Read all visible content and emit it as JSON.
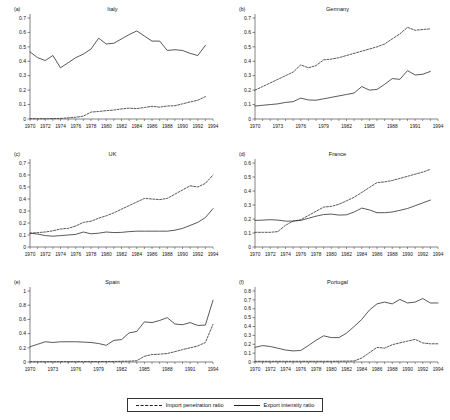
{
  "figure": {
    "legend": {
      "position": "bottom-center",
      "entries": [
        {
          "label": "Import penetration ratio",
          "style": "dashed"
        },
        {
          "label": "Export intensity ratio",
          "style": "solid"
        }
      ]
    },
    "series_names": {
      "import": "Import penetration ratio",
      "export": "Export intensity ratio"
    },
    "colors": {
      "line": "#222222",
      "axis": "#333333",
      "background": "#ffffff"
    }
  },
  "chart_data": [
    {
      "type": "line",
      "panel": "(a)",
      "title": "Italy",
      "xlabel": "",
      "ylabel": "",
      "xlim": [
        1970,
        1994
      ],
      "ylim": [
        0,
        0.7
      ],
      "yticks": [
        0,
        0.1,
        0.2,
        0.3,
        0.4,
        0.5,
        0.6,
        0.7
      ],
      "yticklabels": [
        "0",
        "0.1",
        "0.2",
        "0.3",
        "0.4",
        "0.5",
        "0.6",
        "0.7"
      ],
      "xticks": [
        1970,
        1972,
        1974,
        1976,
        1978,
        1980,
        1982,
        1984,
        1986,
        1988,
        1990,
        1992,
        1994
      ],
      "xticklabels": [
        "1970",
        "1972",
        "1974",
        "1976",
        "1978",
        "1980",
        "1982",
        "1984",
        "1986",
        "1988",
        "1990",
        "1992",
        "1994"
      ],
      "grid": false,
      "x": [
        1970,
        1971,
        1972,
        1973,
        1974,
        1975,
        1976,
        1977,
        1978,
        1979,
        1980,
        1981,
        1982,
        1983,
        1984,
        1985,
        1986,
        1987,
        1988,
        1989,
        1990,
        1991,
        1992,
        1993
      ],
      "series": [
        {
          "name": "Export intensity ratio",
          "style": "solid",
          "values": [
            0.465,
            0.425,
            0.405,
            0.44,
            0.355,
            0.39,
            0.425,
            0.45,
            0.485,
            0.56,
            0.52,
            0.525,
            0.555,
            0.585,
            0.61,
            0.575,
            0.54,
            0.54,
            0.475,
            0.48,
            0.475,
            0.455,
            0.44,
            0.51
          ]
        },
        {
          "name": "Import penetration ratio",
          "style": "dashed",
          "values": [
            0.002,
            0.002,
            0.002,
            0.003,
            0.004,
            0.008,
            0.012,
            0.02,
            0.048,
            0.052,
            0.058,
            0.062,
            0.07,
            0.075,
            0.072,
            0.08,
            0.088,
            0.082,
            0.09,
            0.092,
            0.105,
            0.118,
            0.13,
            0.155
          ]
        }
      ]
    },
    {
      "type": "line",
      "panel": "(b)",
      "title": "Germany",
      "xlabel": "",
      "ylabel": "",
      "xlim": [
        1970,
        1994
      ],
      "ylim": [
        0,
        0.7
      ],
      "yticks": [
        0,
        0.1,
        0.2,
        0.3,
        0.4,
        0.5,
        0.6,
        0.7
      ],
      "yticklabels": [
        "0",
        "0.1",
        "0.2",
        "0.3",
        "0.4",
        "0.5",
        "0.6",
        "0.7"
      ],
      "xticks": [
        1970,
        1973,
        1976,
        1979,
        1982,
        1985,
        1988,
        1991,
        1994
      ],
      "xticklabels": [
        "1970",
        "1973",
        "1976",
        "1979",
        "1982",
        "1985",
        "1988",
        "1991",
        "1994"
      ],
      "grid": false,
      "x": [
        1970,
        1971,
        1972,
        1973,
        1974,
        1975,
        1976,
        1977,
        1978,
        1979,
        1980,
        1981,
        1982,
        1983,
        1984,
        1985,
        1986,
        1987,
        1988,
        1989,
        1990,
        1991,
        1992,
        1993
      ],
      "series": [
        {
          "name": "Import penetration ratio",
          "style": "dashed",
          "values": [
            0.2,
            0.225,
            0.25,
            0.275,
            0.3,
            0.325,
            0.375,
            0.355,
            0.37,
            0.41,
            0.415,
            0.425,
            0.44,
            0.455,
            0.47,
            0.485,
            0.5,
            0.52,
            0.555,
            0.59,
            0.635,
            0.615,
            0.62,
            0.625
          ]
        },
        {
          "name": "Export intensity ratio",
          "style": "solid",
          "values": [
            0.09,
            0.095,
            0.1,
            0.105,
            0.115,
            0.12,
            0.145,
            0.132,
            0.13,
            0.14,
            0.15,
            0.16,
            0.17,
            0.18,
            0.225,
            0.2,
            0.205,
            0.24,
            0.28,
            0.275,
            0.335,
            0.305,
            0.31,
            0.33
          ]
        }
      ]
    },
    {
      "type": "line",
      "panel": "(c)",
      "title": "UK",
      "xlabel": "",
      "ylabel": "",
      "xlim": [
        1970,
        1994
      ],
      "ylim": [
        0,
        0.7
      ],
      "yticks": [
        0,
        0.1,
        0.2,
        0.3,
        0.4,
        0.5,
        0.6,
        0.7
      ],
      "yticklabels": [
        "0",
        "0.1",
        "0.2",
        "0.3",
        "0.4",
        "0.5",
        "0.6",
        "0.7"
      ],
      "xticks": [
        1970,
        1972,
        1974,
        1976,
        1978,
        1980,
        1982,
        1984,
        1986,
        1988,
        1990,
        1992,
        1994
      ],
      "xticklabels": [
        "1970",
        "1972",
        "1974",
        "1976",
        "1978",
        "1980",
        "1982",
        "1984",
        "1986",
        "1988",
        "1990",
        "1992",
        "1994"
      ],
      "grid": false,
      "x": [
        1970,
        1971,
        1972,
        1973,
        1974,
        1975,
        1976,
        1977,
        1978,
        1979,
        1980,
        1981,
        1982,
        1983,
        1984,
        1985,
        1986,
        1987,
        1988,
        1989,
        1990,
        1991,
        1992,
        1993,
        1994
      ],
      "series": [
        {
          "name": "Import penetration ratio",
          "style": "dashed",
          "values": [
            0.115,
            0.12,
            0.125,
            0.135,
            0.15,
            0.155,
            0.175,
            0.205,
            0.215,
            0.24,
            0.26,
            0.285,
            0.315,
            0.345,
            0.375,
            0.405,
            0.4,
            0.395,
            0.405,
            0.44,
            0.475,
            0.51,
            0.5,
            0.53,
            0.6
          ]
        },
        {
          "name": "Export intensity ratio",
          "style": "solid",
          "values": [
            0.115,
            0.108,
            0.095,
            0.09,
            0.095,
            0.1,
            0.105,
            0.125,
            0.11,
            0.115,
            0.125,
            0.12,
            0.122,
            0.128,
            0.132,
            0.132,
            0.132,
            0.132,
            0.132,
            0.14,
            0.155,
            0.18,
            0.205,
            0.245,
            0.32
          ]
        }
      ]
    },
    {
      "type": "line",
      "panel": "(d)",
      "title": "France",
      "xlabel": "",
      "ylabel": "",
      "xlim": [
        1970,
        1994
      ],
      "ylim": [
        0,
        0.6
      ],
      "yticks": [
        0,
        0.1,
        0.2,
        0.3,
        0.4,
        0.5,
        0.6
      ],
      "yticklabels": [
        "0",
        "0.1",
        "0.2",
        "0.3",
        "0.4",
        "0.5",
        "0.6"
      ],
      "xticks": [
        1970,
        1972,
        1974,
        1976,
        1978,
        1980,
        1982,
        1984,
        1986,
        1988,
        1990,
        1992,
        1994
      ],
      "xticklabels": [
        "1970",
        "1972",
        "1974",
        "1976",
        "1978",
        "1980",
        "1982",
        "1984",
        "1986",
        "1988",
        "1990",
        "1992",
        "1994"
      ],
      "grid": false,
      "x": [
        1970,
        1971,
        1972,
        1973,
        1974,
        1975,
        1976,
        1977,
        1978,
        1979,
        1980,
        1981,
        1982,
        1983,
        1984,
        1985,
        1986,
        1987,
        1988,
        1989,
        1990,
        1991,
        1992,
        1993
      ],
      "series": [
        {
          "name": "Import penetration ratio",
          "style": "dashed",
          "values": [
            0.105,
            0.105,
            0.105,
            0.11,
            0.155,
            0.185,
            0.195,
            0.225,
            0.255,
            0.285,
            0.29,
            0.305,
            0.33,
            0.355,
            0.39,
            0.425,
            0.46,
            0.465,
            0.475,
            0.49,
            0.505,
            0.52,
            0.535,
            0.555
          ]
        },
        {
          "name": "Export intensity ratio",
          "style": "solid",
          "values": [
            0.19,
            0.192,
            0.195,
            0.192,
            0.185,
            0.185,
            0.19,
            0.205,
            0.22,
            0.232,
            0.235,
            0.228,
            0.23,
            0.25,
            0.278,
            0.265,
            0.245,
            0.245,
            0.25,
            0.262,
            0.275,
            0.295,
            0.315,
            0.335
          ]
        }
      ]
    },
    {
      "type": "line",
      "panel": "(e)",
      "title": "Spain",
      "xlabel": "",
      "ylabel": "",
      "xlim": [
        1970,
        1994
      ],
      "ylim": [
        0,
        1.0
      ],
      "yticks": [
        0,
        0.2,
        0.4,
        0.6,
        0.8,
        1
      ],
      "yticklabels": [
        "0",
        "0.2",
        "0.4",
        "0.6",
        "0.8",
        "1"
      ],
      "xticks": [
        1970,
        1973,
        1976,
        1979,
        1982,
        1985,
        1988,
        1991,
        1994
      ],
      "xticklabels": [
        "1970",
        "1973",
        "1976",
        "1979",
        "1982",
        "1985",
        "1988",
        "1991",
        "1994"
      ],
      "grid": false,
      "x": [
        1970,
        1971,
        1972,
        1973,
        1974,
        1975,
        1976,
        1977,
        1978,
        1979,
        1980,
        1981,
        1982,
        1983,
        1984,
        1985,
        1986,
        1987,
        1988,
        1989,
        1990,
        1991,
        1992,
        1993,
        1994
      ],
      "series": [
        {
          "name": "Export intensity ratio",
          "style": "solid",
          "values": [
            0.215,
            0.25,
            0.285,
            0.275,
            0.285,
            0.285,
            0.285,
            0.28,
            0.275,
            0.26,
            0.235,
            0.305,
            0.315,
            0.41,
            0.43,
            0.565,
            0.555,
            0.585,
            0.625,
            0.535,
            0.525,
            0.555,
            0.515,
            0.52,
            0.87
          ]
        },
        {
          "name": "Import penetration ratio",
          "style": "dashed",
          "values": [
            0.004,
            0.004,
            0.004,
            0.004,
            0.005,
            0.005,
            0.005,
            0.006,
            0.006,
            0.006,
            0.007,
            0.008,
            0.01,
            0.012,
            0.018,
            0.08,
            0.105,
            0.11,
            0.12,
            0.145,
            0.175,
            0.2,
            0.225,
            0.275,
            0.53
          ]
        }
      ]
    },
    {
      "type": "line",
      "panel": "(f)",
      "title": "Portugal",
      "xlabel": "",
      "ylabel": "",
      "xlim": [
        1970,
        1994
      ],
      "ylim": [
        0,
        0.8
      ],
      "yticks": [
        0,
        0.1,
        0.2,
        0.3,
        0.4,
        0.5,
        0.6,
        0.7,
        0.8
      ],
      "yticklabels": [
        "0",
        "0.1",
        "0.2",
        "0.3",
        "0.4",
        "0.5",
        "0.6",
        "0.7",
        "0.8"
      ],
      "xticks": [
        1970,
        1972,
        1974,
        1976,
        1978,
        1980,
        1982,
        1984,
        1986,
        1988,
        1990,
        1992,
        1994
      ],
      "xticklabels": [
        "1970",
        "1972",
        "1974",
        "1976",
        "1978",
        "1980",
        "1982",
        "1984",
        "1986",
        "1988",
        "1990",
        "1992",
        "1994"
      ],
      "grid": false,
      "x": [
        1970,
        1971,
        1972,
        1973,
        1974,
        1975,
        1976,
        1977,
        1978,
        1979,
        1980,
        1981,
        1982,
        1983,
        1984,
        1985,
        1986,
        1987,
        1988,
        1989,
        1990,
        1991,
        1992,
        1993,
        1994
      ],
      "series": [
        {
          "name": "Export intensity ratio",
          "style": "solid",
          "values": [
            0.165,
            0.185,
            0.175,
            0.155,
            0.135,
            0.125,
            0.13,
            0.185,
            0.245,
            0.295,
            0.275,
            0.275,
            0.325,
            0.4,
            0.48,
            0.585,
            0.655,
            0.675,
            0.655,
            0.705,
            0.665,
            0.675,
            0.715,
            0.665,
            0.665
          ]
        },
        {
          "name": "Import penetration ratio",
          "style": "dashed",
          "values": [
            0.008,
            0.008,
            0.008,
            0.008,
            0.008,
            0.008,
            0.008,
            0.008,
            0.008,
            0.008,
            0.008,
            0.009,
            0.01,
            0.012,
            0.045,
            0.105,
            0.165,
            0.155,
            0.195,
            0.215,
            0.235,
            0.255,
            0.215,
            0.205,
            0.205
          ]
        }
      ]
    }
  ]
}
